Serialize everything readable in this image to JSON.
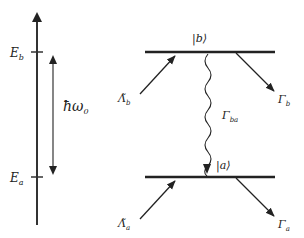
{
  "energy_axis": {
    "upper_level": "E",
    "upper_sub": "b",
    "lower_level": "E",
    "lower_sub": "a",
    "transition_energy": "ħω",
    "transition_sub": "0"
  },
  "levels": {
    "upper_ket": "|b⟩",
    "lower_ket": "|a⟩"
  },
  "rates": {
    "pump_b": "Λ̃",
    "pump_b_sub": "b",
    "decay_b": "Γ",
    "decay_b_sub": "b",
    "decay_ba": "Γ",
    "decay_ba_sub": "ba",
    "pump_a": "Λ̃",
    "pump_a_sub": "a",
    "decay_a": "Γ",
    "decay_a_sub": "a"
  },
  "colors": {
    "line": "#222222",
    "axis": "#333333"
  }
}
